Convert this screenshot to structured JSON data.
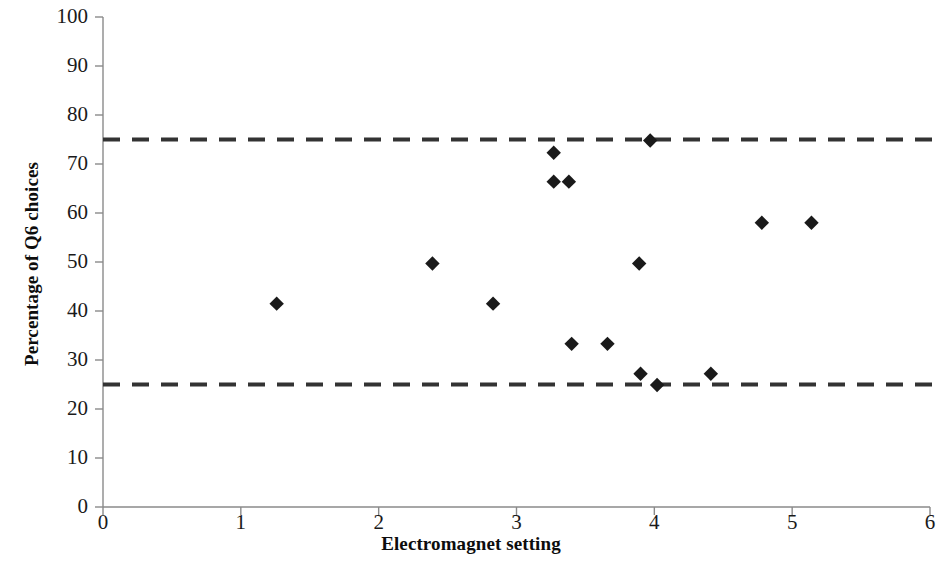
{
  "chart_data": {
    "type": "scatter",
    "title": "",
    "xlabel": "Electromagnet setting",
    "ylabel": "Percentage of Q6 choices",
    "xlim": [
      0,
      6
    ],
    "ylim": [
      0,
      100
    ],
    "xticks": [
      0,
      1,
      2,
      3,
      4,
      5,
      6
    ],
    "yticks": [
      0,
      10,
      20,
      30,
      40,
      50,
      60,
      70,
      80,
      90,
      100
    ],
    "grid": false,
    "legend": "none",
    "marker": "filled-diamond",
    "marker_color": "#1a1a1a",
    "points": [
      {
        "x": 1.26,
        "y": 41.5
      },
      {
        "x": 2.39,
        "y": 49.7
      },
      {
        "x": 2.83,
        "y": 41.5
      },
      {
        "x": 3.27,
        "y": 72.3
      },
      {
        "x": 3.27,
        "y": 66.4
      },
      {
        "x": 3.38,
        "y": 66.4
      },
      {
        "x": 3.4,
        "y": 33.3
      },
      {
        "x": 3.66,
        "y": 33.3
      },
      {
        "x": 3.89,
        "y": 49.7
      },
      {
        "x": 3.9,
        "y": 27.2
      },
      {
        "x": 3.97,
        "y": 74.8
      },
      {
        "x": 4.02,
        "y": 24.9
      },
      {
        "x": 4.41,
        "y": 27.2
      },
      {
        "x": 4.78,
        "y": 58.0
      },
      {
        "x": 5.14,
        "y": 58.0
      }
    ],
    "reference_lines": [
      {
        "name": "upper-chance-bound",
        "y": 75,
        "style": "dashed",
        "color": "#333333"
      },
      {
        "name": "lower-chance-bound",
        "y": 25,
        "style": "dashed",
        "color": "#333333"
      }
    ]
  },
  "axes": {
    "y_tick_labels": [
      "100",
      "90",
      "80",
      "70",
      "60",
      "50",
      "40",
      "30",
      "20",
      "10",
      "0"
    ],
    "x_tick_labels": [
      "0",
      "1",
      "2",
      "3",
      "4",
      "5",
      "6"
    ]
  }
}
